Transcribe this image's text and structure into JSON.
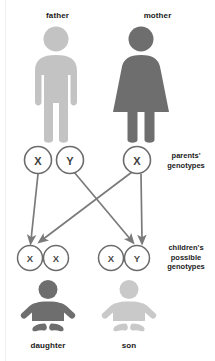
{
  "diagram": {
    "colors": {
      "father_fill": "#c3c3c3",
      "mother_fill": "#6e6e6e",
      "daughter_fill": "#6e6e6e",
      "son_fill": "#c9c9c9",
      "circle_stroke": "#6b6b6b",
      "arrow_color": "#7a7a7a",
      "text_color": "#1a1a1a",
      "allele_color": "#3f3f3f",
      "background": "#ffffff"
    },
    "parents": [
      {
        "id": "father",
        "label": "father",
        "icon": "male-figure-icon",
        "fill": "#c3c3c3"
      },
      {
        "id": "mother",
        "label": "mother",
        "icon": "female-figure-icon",
        "fill": "#6e6e6e"
      }
    ],
    "parent_genotypes": {
      "label_lines": [
        "parents'",
        "genotypes"
      ],
      "alleles": [
        {
          "id": "father-x",
          "symbol": "X",
          "parent": "father"
        },
        {
          "id": "father-y",
          "symbol": "Y",
          "parent": "father"
        },
        {
          "id": "mother-x",
          "symbol": "X",
          "parent": "mother"
        }
      ]
    },
    "children_genotypes": {
      "label_lines": [
        "children's",
        "possible",
        "genotypes"
      ],
      "groups": [
        {
          "id": "daughter-genotype",
          "alleles": [
            {
              "id": "daughter-allele-1",
              "symbol": "X"
            },
            {
              "id": "daughter-allele-2",
              "symbol": "X"
            }
          ]
        },
        {
          "id": "son-genotype",
          "alleles": [
            {
              "id": "son-allele-1",
              "symbol": "X"
            },
            {
              "id": "son-allele-2",
              "symbol": "Y"
            }
          ]
        }
      ]
    },
    "children": [
      {
        "id": "daughter",
        "label": "daughter",
        "icon": "baby-figure-icon",
        "fill": "#6e6e6e"
      },
      {
        "id": "son",
        "label": "son",
        "icon": "baby-figure-icon",
        "fill": "#c9c9c9"
      }
    ],
    "inheritance_arrows": [
      {
        "id": "arrow-father-x-to-daughter",
        "from": "father-x",
        "to": "daughter-allele-1"
      },
      {
        "id": "arrow-mother-x-to-daughter",
        "from": "mother-x",
        "to": "daughter-allele-2"
      },
      {
        "id": "arrow-father-y-to-son",
        "from": "father-y",
        "to": "son-allele-2"
      },
      {
        "id": "arrow-mother-x-to-son",
        "from": "mother-x",
        "to": "son-allele-1"
      }
    ]
  }
}
